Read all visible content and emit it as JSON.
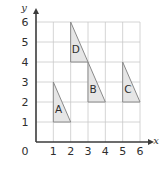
{
  "chart_data": {
    "type": "scatter",
    "title": "",
    "xlabel": "x",
    "ylabel": "y",
    "xlim": [
      0,
      6
    ],
    "ylim": [
      0,
      6
    ],
    "grid": true,
    "legend": "none",
    "x_ticks": [
      "1",
      "2",
      "3",
      "4",
      "5",
      "6"
    ],
    "x_tick_values": [
      1,
      2,
      3,
      4,
      5,
      6
    ],
    "y_ticks": [
      "1",
      "2",
      "3",
      "4",
      "5",
      "6"
    ],
    "y_tick_values": [
      1,
      2,
      3,
      4,
      5,
      6
    ],
    "origin_label": "0",
    "shapes": [
      {
        "label": "A",
        "type": "right-triangle",
        "vertices": [
          [
            1,
            3
          ],
          [
            1,
            1
          ],
          [
            2,
            1
          ]
        ],
        "label_position": [
          1.3,
          1.45
        ],
        "fill": "#e6e6e6",
        "stroke": "#8a8a8a"
      },
      {
        "label": "D",
        "type": "right-triangle",
        "vertices": [
          [
            2,
            6
          ],
          [
            2,
            4
          ],
          [
            3,
            4
          ]
        ],
        "label_position": [
          2.3,
          4.45
        ],
        "fill": "#e6e6e6",
        "stroke": "#8a8a8a"
      },
      {
        "label": "B",
        "type": "right-triangle",
        "vertices": [
          [
            3,
            4
          ],
          [
            3,
            2
          ],
          [
            4,
            2
          ]
        ],
        "label_position": [
          3.3,
          2.45
        ],
        "fill": "#e6e6e6",
        "stroke": "#8a8a8a"
      },
      {
        "label": "C",
        "type": "right-triangle",
        "vertices": [
          [
            5,
            4
          ],
          [
            5,
            2
          ],
          [
            6,
            2
          ]
        ],
        "label_position": [
          5.3,
          2.45
        ],
        "fill": "#e6e6e6",
        "stroke": "#8a8a8a"
      }
    ]
  },
  "axes": {
    "x_axis_name": "x",
    "y_axis_name": "y",
    "origin": "0"
  },
  "colors": {
    "grid": "#c9c9c9",
    "axis": "#3b3b3b",
    "shape_fill": "#e6e6e6",
    "shape_stroke": "#8a8a8a",
    "text": "#2e2e2e",
    "background": "#ffffff"
  }
}
